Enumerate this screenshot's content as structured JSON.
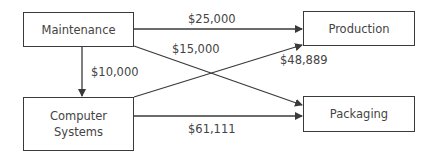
{
  "diagram": {
    "nodes": [
      {
        "id": "maintenance",
        "label": "Maintenance"
      },
      {
        "id": "production",
        "label": "Production"
      },
      {
        "id": "computer_systems",
        "label": "Computer\nSystems",
        "line1": "Computer",
        "line2": "Systems"
      },
      {
        "id": "packaging",
        "label": "Packaging"
      }
    ],
    "edges": [
      {
        "from": "maintenance",
        "to": "production",
        "label": "$25,000"
      },
      {
        "from": "maintenance",
        "to": "packaging",
        "label": "$15,000"
      },
      {
        "from": "maintenance",
        "to": "computer_systems",
        "label": "$10,000"
      },
      {
        "from": "computer_systems",
        "to": "production",
        "label": "$48,889"
      },
      {
        "from": "computer_systems",
        "to": "packaging",
        "label": "$61,111"
      }
    ],
    "colors": {
      "line": "#3a3a3a",
      "text": "#444444",
      "background": "#ffffff"
    }
  }
}
